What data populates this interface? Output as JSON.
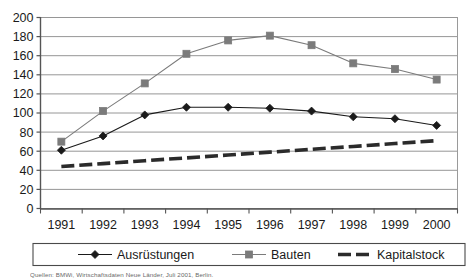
{
  "chart_data": {
    "type": "line",
    "title": "",
    "xlabel": "",
    "ylabel": "",
    "categories": [
      "1991",
      "1992",
      "1993",
      "1994",
      "1995",
      "1996",
      "1997",
      "1998",
      "1999",
      "2000"
    ],
    "ylim": [
      0,
      200
    ],
    "ytick_step": 20,
    "yticks": [
      "0",
      "20",
      "40",
      "60",
      "80",
      "100",
      "120",
      "140",
      "160",
      "180",
      "200"
    ],
    "grid": "horizontal",
    "legend_position": "bottom",
    "series": [
      {
        "name": "Ausrüstungen",
        "marker": "diamond",
        "color": "#1a1a1a",
        "line_style": "solid",
        "values": [
          61,
          76,
          98,
          106,
          106,
          105,
          102,
          96,
          94,
          87
        ]
      },
      {
        "name": "Bauten",
        "marker": "square",
        "color": "#7b7b7b",
        "line_style": "solid",
        "values": [
          70,
          102,
          131,
          162,
          176,
          181,
          171,
          152,
          146,
          135
        ]
      },
      {
        "name": "Kapitalstock",
        "marker": "none",
        "color": "#2b2b2b",
        "line_style": "dashed",
        "values": [
          44,
          47,
          50,
          53,
          56,
          59,
          62,
          65,
          68,
          71
        ]
      }
    ]
  },
  "axis": {
    "y_labels": [
      "200",
      "180",
      "160",
      "140",
      "120",
      "100",
      "80",
      "60",
      "40",
      "20",
      "0"
    ],
    "x_labels": [
      "1991",
      "1992",
      "1993",
      "1994",
      "1995",
      "1996",
      "1997",
      "1998",
      "1999",
      "2000"
    ]
  },
  "legend": {
    "items": [
      {
        "label": "Ausrüstungen",
        "marker": "diamond",
        "color": "#1a1a1a",
        "style": "solid"
      },
      {
        "label": "Bauten",
        "marker": "square",
        "color": "#7b7b7b",
        "style": "solid"
      },
      {
        "label": "Kapitalstock",
        "marker": "none",
        "color": "#2b2b2b",
        "style": "dashed"
      }
    ]
  },
  "footer": {
    "source_note": "Quellen: BMWi, Wirtschaftsdaten Neue Länder, Juli 2001, Berlin."
  },
  "colors": {
    "series_a": "#1a1a1a",
    "series_b": "#7b7b7b",
    "series_c": "#2b2b2b",
    "grid": "#8a8a8a",
    "axis": "#555555",
    "text": "#1a1a1a",
    "legend_border": "#4a4a4a",
    "background": "#ffffff"
  }
}
